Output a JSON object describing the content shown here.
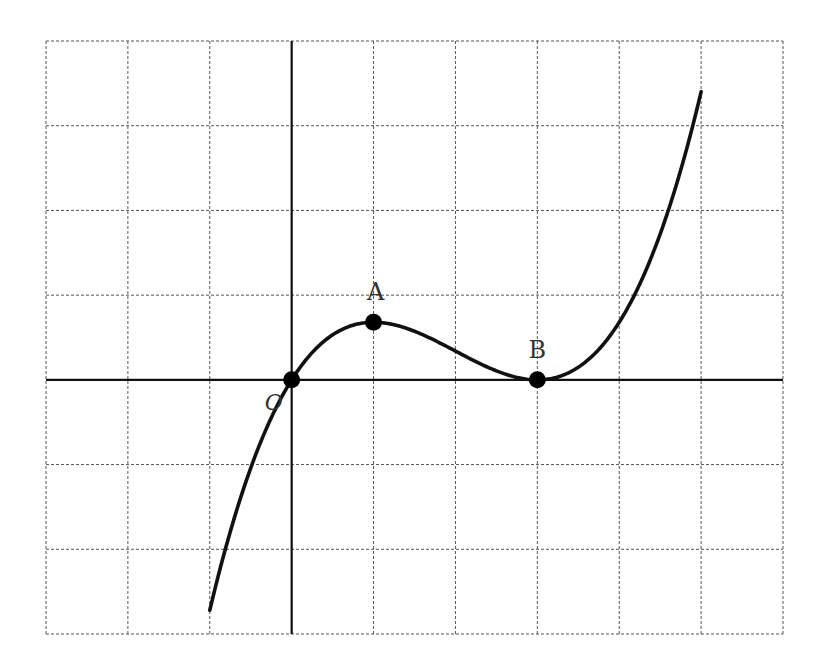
{
  "figure": {
    "grid": {
      "columns": 9,
      "rows": 7,
      "x_range": [
        -3,
        6
      ],
      "y_range": [
        -3,
        4
      ],
      "style": "dashed"
    },
    "axes": {
      "x_axis_y": 0,
      "y_axis_x": 0
    },
    "points": [
      {
        "id": "O",
        "label": "O",
        "x": 0,
        "y": 0
      },
      {
        "id": "A",
        "label": "A",
        "x": 1,
        "y": 0.68
      },
      {
        "id": "B",
        "label": "B",
        "x": 3,
        "y": 0
      }
    ],
    "curve": {
      "formula": "y = k·x(x-3)^2",
      "k": 0.17,
      "x_start": -1,
      "x_end": 5
    },
    "colors": {
      "curve": "#111111",
      "grid": "#555555",
      "points": "#000000",
      "labels": "#333333"
    }
  }
}
